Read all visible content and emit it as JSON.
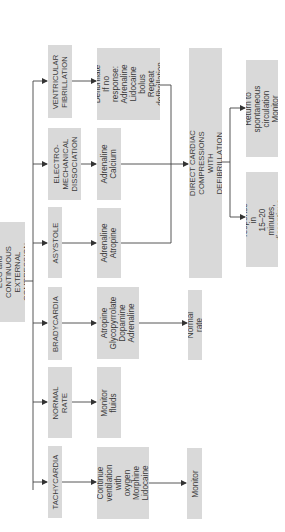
{
  "diagram": {
    "orientation": "rotated 90° counter-clockwise (text reads bottom-to-top)",
    "root": {
      "id": "ecg",
      "label": "ECG and CONTINUOUS\nEXTERNAL COMPRESSION"
    },
    "rhythms": [
      {
        "id": "vf",
        "label": "VENTRICULAR\nFIBRILLATION"
      },
      {
        "id": "emd",
        "label": "ELECTRO-\nMECHANICAL\nDISSOCIATION"
      },
      {
        "id": "asystole",
        "label": "ASYSTOLE"
      },
      {
        "id": "bradycardia",
        "label": "BRADYCARDIA"
      },
      {
        "id": "normal",
        "label": "NORMAL\nRATE"
      },
      {
        "id": "tachycardia",
        "label": "TACHYCARDIA"
      }
    ],
    "treatments": [
      {
        "id": "vf_tx",
        "from": "vf",
        "label": "Defibrillate\nIf no response:\nAdrenaline\nLidocaine bolus\nRepeat\ndefibrillation"
      },
      {
        "id": "emd_tx",
        "from": "emd",
        "label": "Adrenaline\nCalcium"
      },
      {
        "id": "asystole_tx",
        "from": "asystole",
        "label": "Adrenaline\nAtropine"
      },
      {
        "id": "brady_tx",
        "from": "bradycardia",
        "label": "Atropine\nGlycopyrrolate\nDopamine\nAdrenaline"
      },
      {
        "id": "normal_tx",
        "from": "normal",
        "label": "Monitor\nfluids"
      },
      {
        "id": "tachy_tx",
        "from": "tachycardia",
        "label": "Continue\nventilation with\noxygen\nMorphine\nLidocaine"
      }
    ],
    "escalation": {
      "id": "no_response",
      "from": [
        "vf_tx",
        "emd_tx",
        "asystole_tx"
      ],
      "label": "NO RESPONSE IN 5 MINUTES\nDIRECT CARDIAC COMPRESSIONS WITH DEFIBRILLATION\nAND DRUG ADMINISTRATION"
    },
    "outcomes": [
      {
        "id": "rosc",
        "from": "no_response",
        "label": "Return to spontaneous\ncirculation\nMonitor"
      },
      {
        "id": "discontinue",
        "from": "no_response",
        "label": "If no response in\n15–20 minutes,\ndiscontinue CPR"
      },
      {
        "id": "brady_outcome",
        "from": "brady_tx",
        "label": "Normal rate"
      },
      {
        "id": "tachy_outcome",
        "from": "tachy_tx",
        "label": "Monitor"
      }
    ],
    "colors": {
      "box_fill": "#d9d9d9",
      "text": "#3a3a3a",
      "connector": "#444444",
      "background": "#ffffff"
    }
  }
}
